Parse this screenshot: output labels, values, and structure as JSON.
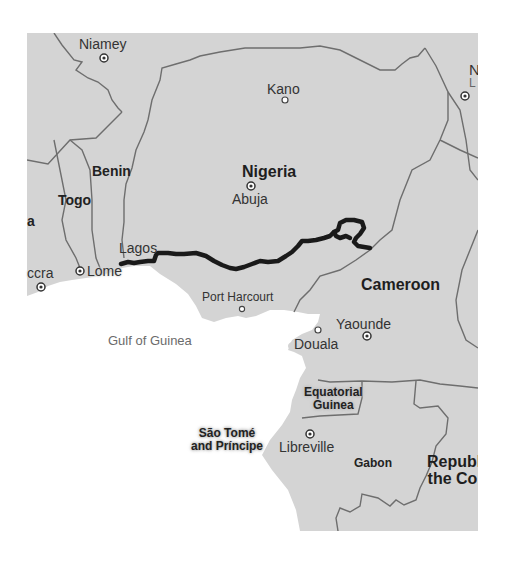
{
  "map": {
    "type": "route-map",
    "region": "West/Central Africa (Gulf of Guinea)",
    "colors": {
      "land": "#d4d4d4",
      "water": "#ffffff",
      "border": "#707070",
      "route": "#1a1a1a",
      "label": "#333333"
    },
    "countries": [
      {
        "name": "Nigeria"
      },
      {
        "name": "Benin"
      },
      {
        "name": "Togo"
      },
      {
        "name": "Cameroon"
      },
      {
        "name": "Equatorial Guinea",
        "line1": "Equatorial",
        "line2": "Guinea"
      },
      {
        "name": "São Tomé and Príncipe",
        "line1": "São Tomé",
        "line2": "and Príncipe"
      },
      {
        "name": "Gabon"
      },
      {
        "name": "Republic of the Congo",
        "line1": "Republ",
        "line2": "the Co"
      },
      {
        "name": "Ghana (partial)",
        "label": "a"
      }
    ],
    "cities": [
      {
        "name": "Niamey",
        "capital": true
      },
      {
        "name": "Kano",
        "capital": false
      },
      {
        "name": "Abuja",
        "capital": true
      },
      {
        "name": "Lagos",
        "capital": false
      },
      {
        "name": "Lome",
        "capital": true
      },
      {
        "name": "Accra",
        "label": "ccra",
        "capital": true
      },
      {
        "name": "Port Harcourt",
        "capital": false
      },
      {
        "name": "Douala",
        "capital": false
      },
      {
        "name": "Yaounde",
        "capital": true
      },
      {
        "name": "Libreville",
        "capital": true
      },
      {
        "name": "N'Djamena (partial)",
        "line1": "N",
        "line2": "L",
        "capital": true
      }
    ],
    "water_bodies": [
      {
        "name": "Gulf of Guinea"
      }
    ],
    "route": {
      "description": "Route from Lagos east across southern Nigeria to Cameroon border",
      "start": "Lagos",
      "end": "Cameroon border"
    }
  }
}
